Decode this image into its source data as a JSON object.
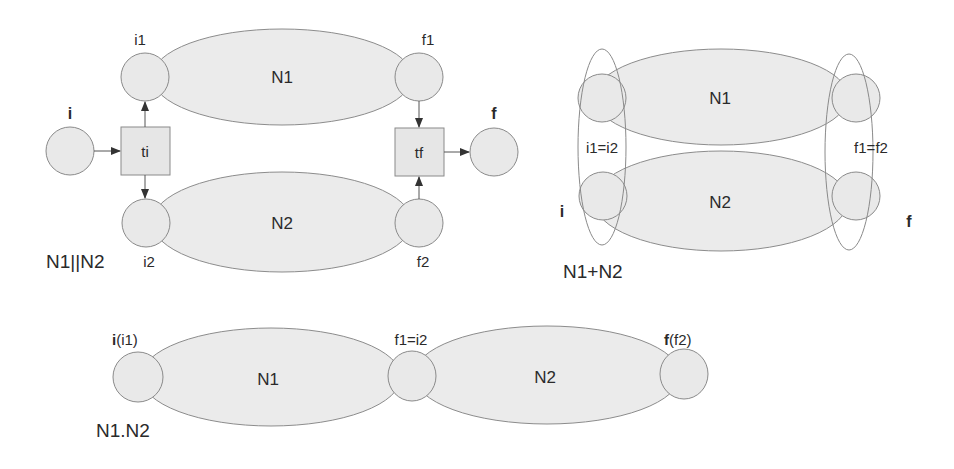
{
  "figure": {
    "colors": {
      "net_fill": "#ebebeb",
      "stroke": "#8a8a8a",
      "arc": "#555555",
      "text": "#2a2a2a"
    }
  },
  "parallel": {
    "caption": "N1||N2",
    "nets": {
      "n1": "N1",
      "n2": "N2"
    },
    "places": {
      "i": "i",
      "i1": "i1",
      "i2": "i2",
      "f1": "f1",
      "f2": "f2",
      "f": "f"
    },
    "transitions": {
      "ti": "ti",
      "tf": "tf"
    }
  },
  "choice": {
    "caption": "N1+N2",
    "nets": {
      "n1": "N1",
      "n2": "N2"
    },
    "labels": {
      "i_merge": "i1=i2",
      "f_merge": "f1=f2",
      "i": "i",
      "f": "f"
    }
  },
  "sequence": {
    "caption": "N1.N2",
    "nets": {
      "n1": "N1",
      "n2": "N2"
    },
    "labels": {
      "start_bold": "i",
      "start_rest": "(i1)",
      "middle": "f1=i2",
      "end_bold": "f",
      "end_rest": "(f2)"
    }
  }
}
